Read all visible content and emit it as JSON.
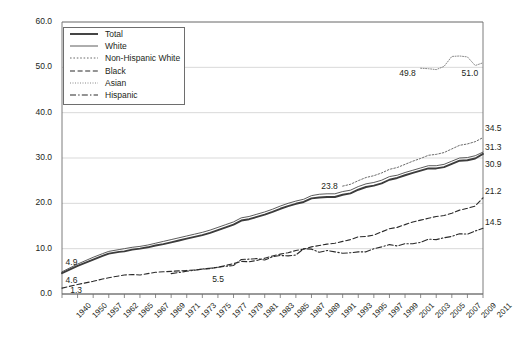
{
  "chart_data": {
    "type": "line",
    "title": "",
    "subtitle": "",
    "xlabel": "",
    "ylabel": "",
    "xlim": [
      1940,
      2011
    ],
    "ylim": [
      0.0,
      60.0
    ],
    "yticks": [
      "0.0",
      "10.0",
      "20.0",
      "30.0",
      "40.0",
      "50.0",
      "60.0"
    ],
    "ytick_values": [
      0,
      10,
      20,
      30,
      40,
      50,
      60
    ],
    "grid": "horizontal",
    "legend_position": "top-left-inset",
    "xticks": [
      "1940",
      "1950",
      "1957",
      "1962",
      "1965",
      "1967",
      "1969",
      "1971",
      "1973",
      "1975",
      "1977",
      "1979",
      "1981",
      "1983",
      "1985",
      "1987",
      "1989",
      "1991",
      "1993",
      "1995",
      "1997",
      "1999",
      "2001",
      "2003",
      "2005",
      "2007",
      "2009",
      "2011"
    ],
    "series": [
      {
        "name": "Total",
        "style": "thick-solid",
        "color": "#3c3c3c",
        "x": [
          1940,
          1950,
          1957,
          1960,
          1962,
          1964,
          1965,
          1966,
          1967,
          1968,
          1969,
          1970,
          1971,
          1972,
          1973,
          1974,
          1975,
          1976,
          1977,
          1978,
          1979,
          1980,
          1981,
          1982,
          1983,
          1984,
          1985,
          1986,
          1987,
          1988,
          1989,
          1990,
          1991,
          1992,
          1993,
          1994,
          1995,
          1996,
          1997,
          1998,
          1999,
          2000,
          2001,
          2002,
          2003,
          2004,
          2005,
          2006,
          2007,
          2008,
          2009,
          2010,
          2011
        ],
        "y": [
          4.6,
          6.2,
          7.6,
          8.4,
          8.9,
          9.3,
          9.4,
          9.8,
          10.0,
          10.3,
          10.7,
          11.0,
          11.4,
          11.8,
          12.2,
          12.6,
          13.0,
          13.5,
          14.1,
          14.7,
          15.3,
          16.2,
          16.5,
          17.0,
          17.5,
          18.1,
          18.8,
          19.4,
          19.9,
          20.3,
          21.1,
          21.3,
          21.4,
          21.4,
          21.9,
          22.2,
          23.0,
          23.6,
          23.9,
          24.4,
          25.2,
          25.6,
          26.2,
          26.7,
          27.2,
          27.7,
          27.7,
          28.0,
          28.7,
          29.4,
          29.5,
          29.9,
          30.9
        ]
      },
      {
        "name": "White",
        "style": "thin-solid",
        "color": "#4a4a4a",
        "x": [
          1940,
          1950,
          1957,
          1960,
          1962,
          1964,
          1965,
          1966,
          1967,
          1968,
          1969,
          1970,
          1971,
          1972,
          1973,
          1974,
          1975,
          1976,
          1977,
          1978,
          1979,
          1980,
          1981,
          1982,
          1983,
          1984,
          1985,
          1986,
          1987,
          1988,
          1989,
          1990,
          1991,
          1992,
          1993,
          1994,
          1995,
          1996,
          1997,
          1998,
          1999,
          2000,
          2001,
          2002,
          2003,
          2004,
          2005,
          2006,
          2007,
          2008,
          2009,
          2010,
          2011
        ],
        "y": [
          4.9,
          6.6,
          8.1,
          8.9,
          9.4,
          9.8,
          10.0,
          10.3,
          10.5,
          10.8,
          11.2,
          11.6,
          12.0,
          12.4,
          12.8,
          13.2,
          13.6,
          14.1,
          14.7,
          15.3,
          15.9,
          16.8,
          17.1,
          17.6,
          18.1,
          18.7,
          19.4,
          20.0,
          20.5,
          20.9,
          21.7,
          22.0,
          22.1,
          22.1,
          22.6,
          22.9,
          23.7,
          24.3,
          24.6,
          25.1,
          25.9,
          26.2,
          26.8,
          27.3,
          27.8,
          28.3,
          28.3,
          28.6,
          29.3,
          30.0,
          30.1,
          30.5,
          31.3
        ]
      },
      {
        "name": "Non-Hispanic White",
        "style": "dotted",
        "color": "#5a5a5a",
        "x": [
          1993,
          1994,
          1995,
          1996,
          1997,
          1998,
          1999,
          2000,
          2001,
          2002,
          2003,
          2004,
          2005,
          2006,
          2007,
          2008,
          2009,
          2010,
          2011
        ],
        "y": [
          23.8,
          24.2,
          25.0,
          25.7,
          26.1,
          26.7,
          27.5,
          27.9,
          28.6,
          29.3,
          29.9,
          30.6,
          30.8,
          31.2,
          32.0,
          32.8,
          33.1,
          33.6,
          34.5
        ]
      },
      {
        "name": "Black",
        "style": "dashed",
        "color": "#2a2a2a",
        "x": [
          1940,
          1950,
          1957,
          1960,
          1962,
          1964,
          1965,
          1966,
          1967,
          1968,
          1969,
          1970,
          1971,
          1972,
          1973,
          1974,
          1975,
          1976,
          1977,
          1978,
          1979,
          1980,
          1981,
          1982,
          1983,
          1984,
          1985,
          1986,
          1987,
          1988,
          1989,
          1990,
          1991,
          1992,
          1993,
          1994,
          1995,
          1996,
          1997,
          1998,
          1999,
          2000,
          2001,
          2002,
          2003,
          2004,
          2005,
          2006,
          2007,
          2008,
          2009,
          2010,
          2011
        ],
        "y": [
          1.3,
          2.1,
          2.8,
          3.3,
          3.6,
          4.0,
          4.2,
          4.3,
          4.2,
          4.5,
          4.8,
          4.9,
          5.0,
          5.1,
          5.2,
          5.3,
          5.5,
          5.6,
          5.9,
          6.3,
          6.7,
          7.2,
          7.1,
          7.4,
          7.9,
          8.4,
          8.8,
          9.1,
          9.6,
          9.9,
          10.4,
          10.7,
          11.0,
          11.2,
          11.6,
          12.0,
          12.6,
          12.7,
          13.0,
          13.7,
          14.4,
          14.7,
          15.3,
          15.9,
          16.3,
          16.7,
          17.1,
          17.3,
          17.8,
          18.5,
          18.9,
          19.4,
          21.2
        ]
      },
      {
        "name": "Asian",
        "style": "fine-dotted",
        "color": "#6a6a6a",
        "x": [
          2003,
          2004,
          2005,
          2006,
          2007,
          2008,
          2009,
          2010,
          2011
        ],
        "y": [
          49.8,
          49.7,
          49.5,
          50.2,
          52.4,
          52.5,
          52.3,
          50.4,
          51.0
        ]
      },
      {
        "name": "Hispanic",
        "style": "dash-dot",
        "color": "#2a2a2a",
        "x": [
          1971,
          1973,
          1975,
          1977,
          1979,
          1980,
          1981,
          1982,
          1983,
          1984,
          1985,
          1986,
          1987,
          1988,
          1989,
          1990,
          1991,
          1992,
          1993,
          1994,
          1995,
          1996,
          1997,
          1998,
          1999,
          2000,
          2001,
          2002,
          2003,
          2004,
          2005,
          2006,
          2007,
          2008,
          2009,
          2010,
          2011
        ],
        "y": [
          4.5,
          5.0,
          5.5,
          5.9,
          6.3,
          7.6,
          7.7,
          7.8,
          7.5,
          8.2,
          8.5,
          8.4,
          8.6,
          10.0,
          9.9,
          9.2,
          9.6,
          9.3,
          9.0,
          9.1,
          9.3,
          9.3,
          10.0,
          10.4,
          10.9,
          10.6,
          11.1,
          11.1,
          11.4,
          12.1,
          12.0,
          12.4,
          12.7,
          13.3,
          13.2,
          13.9,
          14.5
        ]
      }
    ],
    "annotations": [
      {
        "text": "4.9",
        "x": 1941,
        "y": 6.9,
        "series": "White"
      },
      {
        "text": "4.6",
        "x": 1941,
        "y": 2.9,
        "series": "Total"
      },
      {
        "text": "1.3",
        "x": 1944,
        "y": 0.6,
        "series": "Black"
      },
      {
        "text": "5.5",
        "x": 1976,
        "y": 3.0,
        "series": "Black"
      },
      {
        "text": "23.8",
        "x": 1990,
        "y": 23.5,
        "series": "Non-Hispanic White"
      },
      {
        "text": "49.8",
        "x": 2000,
        "y": 48.6,
        "series": "Asian"
      },
      {
        "text": "51.0",
        "x": 2008,
        "y": 48.6,
        "series": "Asian"
      },
      {
        "text": "34.5",
        "x": 2011,
        "y": 36.3,
        "series": "Non-Hispanic White"
      },
      {
        "text": "31.3",
        "x": 2011,
        "y": 32.3,
        "series": "White"
      },
      {
        "text": "30.9",
        "x": 2011,
        "y": 28.4,
        "series": "Total"
      },
      {
        "text": "21.2",
        "x": 2011,
        "y": 22.4,
        "series": "Black"
      },
      {
        "text": "14.5",
        "x": 2011,
        "y": 15.6,
        "series": "Hispanic"
      }
    ]
  },
  "legend": {
    "items": [
      {
        "label": "Total",
        "style": "thick-solid"
      },
      {
        "label": "White",
        "style": "thin-solid"
      },
      {
        "label": "Non-Hispanic White",
        "style": "dotted"
      },
      {
        "label": "Black",
        "style": "dashed"
      },
      {
        "label": "Asian",
        "style": "fine-dotted"
      },
      {
        "label": "Hispanic",
        "style": "dash-dot"
      }
    ]
  },
  "colors": {
    "axis": "#6e6e6e",
    "grid": "#c9c9c9",
    "text": "#231f20",
    "background": "#ffffff"
  }
}
